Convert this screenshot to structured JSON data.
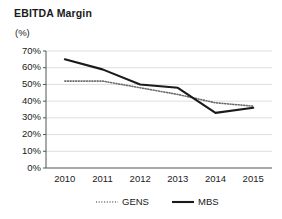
{
  "chart_data": {
    "type": "line",
    "title": "EBITDA Margin",
    "ylabel": "(%)",
    "xlabel": "",
    "categories": [
      "2010",
      "2011",
      "2012",
      "2013",
      "2014",
      "2015"
    ],
    "series": [
      {
        "name": "GENS",
        "style": "dotted",
        "color": "#6b6b6b",
        "values": [
          52,
          52,
          48,
          44,
          39,
          37
        ]
      },
      {
        "name": "MBS",
        "style": "solid",
        "color": "#1a1a1a",
        "values": [
          65,
          59,
          50,
          48,
          33,
          36
        ]
      }
    ],
    "ylim": [
      0,
      70
    ],
    "yticks": [
      0,
      10,
      20,
      30,
      40,
      50,
      60,
      70
    ],
    "ytick_labels": [
      "0%",
      "10%",
      "20%",
      "30%",
      "40%",
      "50%",
      "60%",
      "70%"
    ],
    "grid": true,
    "legend_position": "bottom"
  }
}
